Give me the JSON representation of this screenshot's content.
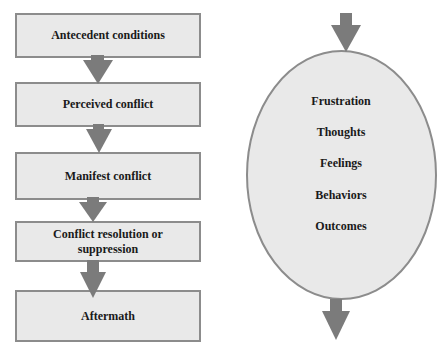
{
  "left_flow": {
    "steps": [
      {
        "label": "Antecedent conditions"
      },
      {
        "label": "Perceived conflict"
      },
      {
        "label": "Manifest conflict"
      },
      {
        "label": "Conflict resolution or suppression"
      },
      {
        "label": "Aftermath"
      }
    ]
  },
  "right_oval": {
    "items": [
      {
        "label": "Frustration"
      },
      {
        "label": "Thoughts"
      },
      {
        "label": "Feelings"
      },
      {
        "label": "Behaviors"
      },
      {
        "label": "Outcomes"
      }
    ]
  },
  "colors": {
    "box_fill": "#e9e9e9",
    "box_border": "#8c8c8c",
    "arrow": "#7b7b7b",
    "oval_fill": "#e9e9e9",
    "oval_border": "#8c8c8c",
    "text": "#1a1a1a"
  }
}
